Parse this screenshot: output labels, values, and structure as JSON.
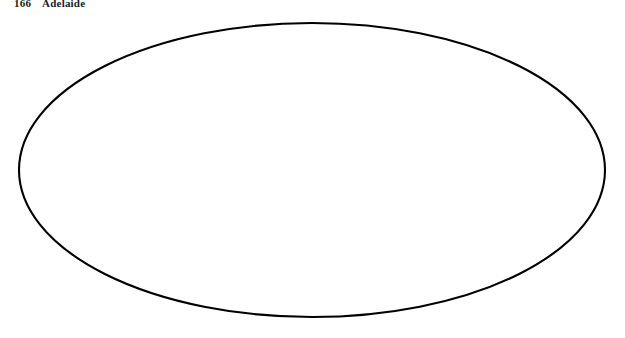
{
  "page": {
    "folio": "166",
    "running_title": "Adelaide",
    "background_color": "#ffffff"
  },
  "map": {
    "name": "world-oval-projection-map",
    "projection": "oblique oval (Aitoff/Hammer style) world projection",
    "border_color": "#000000",
    "graticule_color": "#9a9aa2",
    "coastline_color": "#6b6b72",
    "shaded_region_color": "#9b9b9b",
    "wedge_outline_color": "#000000",
    "oval": {
      "cx": 312,
      "cy": 170,
      "rx": 294,
      "ry": 148
    },
    "center_disc": {
      "cx": 342,
      "cy": 96,
      "r": 17,
      "fill": "#ffffff"
    },
    "center_point": {
      "cx": 342,
      "cy": 96,
      "r": 1.8,
      "label": "projection-center-dot"
    },
    "site_marker": {
      "cx": 108,
      "cy": 263,
      "r": 2.1,
      "label": "adelaide-site-dot"
    },
    "graticule": {
      "meridian_step_degrees": 30,
      "parallel_step_degrees": 30,
      "tick_labels_visible": true,
      "tick_label_note": "small illegible numeric graticule tick labels"
    },
    "legend_note": "",
    "tick_labels": [
      "0",
      "30",
      "60",
      "90",
      "120",
      "150",
      "180",
      "30",
      "60",
      "90",
      "120",
      "150"
    ]
  }
}
